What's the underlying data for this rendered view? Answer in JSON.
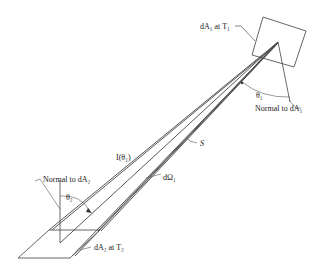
{
  "diagram": {
    "labels": {
      "dA1": "dA₁ at T₁",
      "normal_dA1": "Normal to dA₁",
      "theta1": "θ₁",
      "S": "S",
      "I_theta1": "I(θ₁)",
      "dOmega1": "dΩ₁",
      "normal_dA2": "Normal to dA₂",
      "theta2": "θ₂",
      "dA2": "dA₂ at T₂"
    },
    "colors": {
      "line": "#333333",
      "background": "#ffffff"
    }
  }
}
